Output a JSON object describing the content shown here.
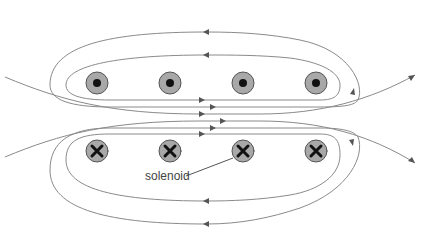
{
  "diagram": {
    "label": "solenoid",
    "colors": {
      "field_line": "#8a8a8a",
      "arrow": "#555555",
      "coil_fill": "#a8a8a8",
      "coil_stroke": "#555555",
      "symbol": "#111111",
      "label": "#444444"
    },
    "coils_top": [
      {
        "x": 97,
        "y": 83,
        "symbol": "dot-out-of-page"
      },
      {
        "x": 170,
        "y": 83,
        "symbol": "dot-out-of-page"
      },
      {
        "x": 243,
        "y": 83,
        "symbol": "dot-out-of-page"
      },
      {
        "x": 316,
        "y": 83,
        "symbol": "dot-out-of-page"
      }
    ],
    "coils_bottom": [
      {
        "x": 97,
        "y": 151,
        "symbol": "cross-into-page"
      },
      {
        "x": 170,
        "y": 151,
        "symbol": "cross-into-page"
      },
      {
        "x": 243,
        "y": 151,
        "symbol": "cross-into-page"
      },
      {
        "x": 316,
        "y": 151,
        "symbol": "cross-into-page"
      }
    ]
  }
}
